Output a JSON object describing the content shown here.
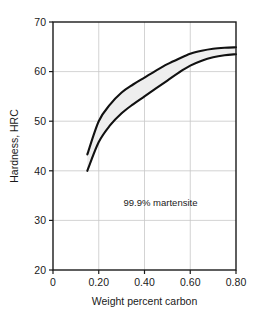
{
  "chart_data": {
    "type": "area",
    "title": "",
    "xlabel": "Weight percent carbon",
    "ylabel": "Hardness, HRC",
    "xlim": [
      0,
      0.8
    ],
    "ylim": [
      20,
      70
    ],
    "xticks": [
      0,
      0.2,
      0.4,
      0.6,
      0.8
    ],
    "xtick_labels": [
      "0",
      "0.20",
      "0.40",
      "0.60",
      "0.80"
    ],
    "yticks": [
      20,
      30,
      40,
      50,
      60,
      70
    ],
    "ytick_labels": [
      "20",
      "30",
      "40",
      "50",
      "60",
      "70"
    ],
    "grid": true,
    "legend": "none",
    "annotations": [
      {
        "text": "99.9% martensite",
        "x": 0.47,
        "y": 33.0
      }
    ],
    "band_fill_color": "#eeeeee",
    "band_line_color": "#111111",
    "grid_color": "#c8c8c8",
    "axis_color": "#1a1a1a",
    "series": [
      {
        "name": "upper bound",
        "x": [
          0.15,
          0.2,
          0.25,
          0.3,
          0.35,
          0.4,
          0.45,
          0.5,
          0.55,
          0.6,
          0.65,
          0.7,
          0.75,
          0.8
        ],
        "values": [
          43.3,
          50.0,
          53.4,
          55.8,
          57.4,
          58.8,
          60.2,
          61.5,
          62.6,
          63.6,
          64.2,
          64.6,
          64.8,
          64.9
        ]
      },
      {
        "name": "lower bound",
        "x": [
          0.15,
          0.2,
          0.25,
          0.3,
          0.35,
          0.4,
          0.45,
          0.5,
          0.55,
          0.6,
          0.65,
          0.7,
          0.75,
          0.8
        ],
        "values": [
          40.0,
          45.8,
          49.2,
          51.6,
          53.4,
          55.0,
          56.6,
          58.2,
          59.8,
          61.2,
          62.2,
          62.9,
          63.3,
          63.5
        ]
      }
    ]
  }
}
